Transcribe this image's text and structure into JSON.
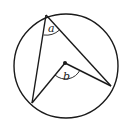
{
  "diagram": {
    "type": "inscribed-and-central-angle",
    "labels": {
      "inscribed_angle": "a",
      "central_angle": "b"
    },
    "colors": {
      "stroke": "#1a1a1a",
      "background": "#ffffff"
    }
  }
}
